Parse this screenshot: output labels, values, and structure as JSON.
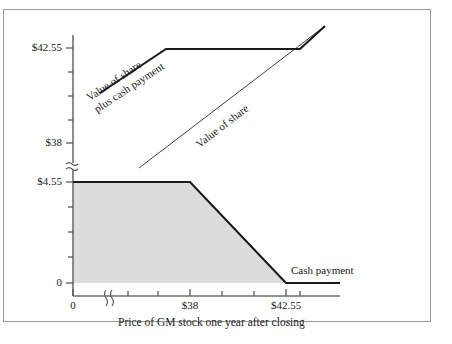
{
  "figure": {
    "border_color": "#9a9a9a",
    "background": "#ffffff",
    "line_color": "#1a1a1a",
    "fill_color": "#dcdcdc"
  },
  "chart_data": {
    "type": "line",
    "title": "",
    "subtitle": "",
    "xlabel": "Price of GM stock one year after closing",
    "ylabel": "",
    "grid": false,
    "legend": "inline-annotations",
    "axis_breaks": {
      "y_break_symbol": "≈",
      "x_break_symbol": "((",
      "note_y": "y-axis broken between $4.55 and $38",
      "note_x": "x-axis broken between 0 and $38"
    },
    "x_ticks": [
      {
        "label": "0",
        "value": 0
      },
      {
        "label": "",
        "value": 1
      },
      {
        "label": "",
        "value": 2
      },
      {
        "label": "$38",
        "value": 38
      },
      {
        "label": "",
        "value": 39.5
      },
      {
        "label": "",
        "value": 41
      },
      {
        "label": "$42.55",
        "value": 42.55
      },
      {
        "label": "",
        "value": 43.5
      }
    ],
    "y_ticks_upper": [
      {
        "label": "$42.55",
        "value": 42.55
      },
      {
        "label": "",
        "value": 41.7
      },
      {
        "label": "",
        "value": 40.8
      },
      {
        "label": "",
        "value": 39.9
      },
      {
        "label": "$38",
        "value": 38.0
      }
    ],
    "y_ticks_lower": [
      {
        "label": "$4.55",
        "value": 4.55
      },
      {
        "label": "",
        "value": 3.4
      },
      {
        "label": "",
        "value": 2.3
      },
      {
        "label": "",
        "value": 1.15
      },
      {
        "label": "0",
        "value": 0
      }
    ],
    "xlim": [
      0,
      44.5
    ],
    "series": [
      {
        "name": "Value of share plus cash payment",
        "style": "thick",
        "points": [
          [
            36.3,
            41.1
          ],
          [
            38.0,
            42.55
          ],
          [
            42.55,
            42.55
          ],
          [
            44.2,
            44.3
          ]
        ],
        "description": "Rises to $42.55 at stock price $38, flat at $42.55 through $42.55, then rises 45 degrees"
      },
      {
        "name": "Value of share",
        "style": "thin",
        "points": [
          [
            36.4,
            36.4
          ],
          [
            44.0,
            44.0
          ]
        ],
        "description": "45-degree line, value equals stock price"
      },
      {
        "name": "Cash payment",
        "style": "thick-filled",
        "points": [
          [
            0,
            4.55
          ],
          [
            38.0,
            4.55
          ],
          [
            42.55,
            0
          ],
          [
            44.5,
            0
          ]
        ],
        "description": "Flat at $4.55 until stock price $38, declines linearly to 0 at $42.55, then 0"
      }
    ],
    "annotations": [
      {
        "text": "Value of share plus cash payment",
        "rotation": -38,
        "placement": "upper-left"
      },
      {
        "text": "Value of share",
        "rotation": -38,
        "placement": "middle"
      },
      {
        "text": "Cash payment",
        "rotation": 0,
        "placement": "lower-right"
      }
    ]
  }
}
